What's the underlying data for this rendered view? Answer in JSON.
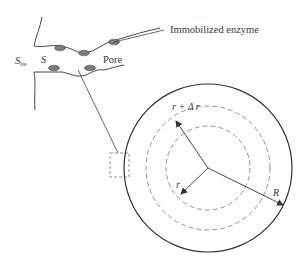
{
  "diagram": {
    "type": "pore and spherical particle schematic",
    "labels": {
      "immobilized_enzyme": "Immobilized enzyme",
      "pore": "Pore",
      "s_bs_main": "S",
      "s_bs_sub": "bs",
      "s": "S",
      "r_plus_dr": "r + Δ r",
      "r": "r",
      "R": "R"
    },
    "colors": {
      "line": "#333333",
      "enzyme_fill": "#7a7a7a",
      "enzyme_stroke": "#555555",
      "dashed": "#777777",
      "background": "#ffffff"
    },
    "particle": {
      "center": [
        208,
        168
      ],
      "outer_radius": 84,
      "dashed_radii": [
        62,
        42
      ]
    },
    "enzymes": [
      {
        "cx": 60,
        "cy": 48
      },
      {
        "cx": 84,
        "cy": 53
      },
      {
        "cx": 114,
        "cy": 42
      },
      {
        "cx": 54,
        "cy": 68
      },
      {
        "cx": 90,
        "cy": 68
      }
    ]
  }
}
